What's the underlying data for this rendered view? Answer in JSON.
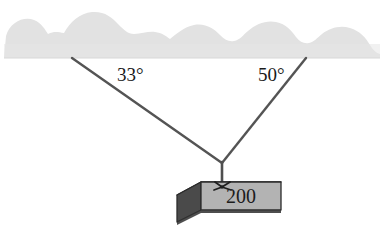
{
  "figure": {
    "background_color": "#ffffff"
  },
  "ceiling": {
    "name": "ceiling-surface",
    "fill_color": "#e2e2e2",
    "edge_color": "#d6d6d6",
    "bottom_y": 58
  },
  "cables": {
    "stroke_color": "#545454",
    "left": {
      "label": "33°",
      "angle_degrees": 33,
      "anchor": {
        "x": 72,
        "y": 58
      },
      "junction": {
        "x": 222,
        "y": 163
      }
    },
    "right": {
      "label": "50°",
      "angle_degrees": 50,
      "anchor": {
        "x": 306,
        "y": 58
      },
      "junction": {
        "x": 222,
        "y": 163
      }
    },
    "drop": {
      "name": "vertical-drop-cable",
      "from": {
        "x": 222,
        "y": 163
      },
      "to": {
        "x": 222,
        "y": 186
      }
    }
  },
  "labels": {
    "left_angle": "33°",
    "right_angle": "50°",
    "weight": "200"
  },
  "block": {
    "name": "suspended-block",
    "weight_text": "200",
    "front_face_color": "#b3b3b3",
    "top_face_color": "#cfcfcf",
    "side_face_color": "#4a4a4a",
    "outline_color": "#2b2b2b"
  },
  "knot": {
    "name": "rope-knot",
    "color": "#1f1f1f",
    "position": {
      "x": 222,
      "y": 186
    }
  }
}
